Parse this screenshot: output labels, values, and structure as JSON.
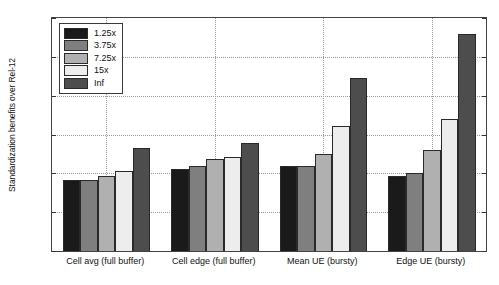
{
  "chart_data": {
    "type": "bar",
    "title": "",
    "xlabel": "",
    "ylabel": "Standardization benefits over Rel-12",
    "ylim": [
      0,
      3
    ],
    "ytick_labels": [
      "0",
      "0.5",
      "1",
      "1.5",
      "2",
      "2.5",
      "3"
    ],
    "ytick_values": [
      0,
      0.5,
      1,
      1.5,
      2,
      2.5,
      3
    ],
    "grid": true,
    "legend_position": "upper left (inside axes)",
    "categories": [
      "Cell avg (full buffer)",
      "Cell edge (full buffer)",
      "Mean UE (bursty)",
      "Edge UE (bursty)"
    ],
    "series": [
      {
        "name": "1.25x",
        "color": "#1a1a1a",
        "values": [
          0.91,
          1.06,
          1.09,
          0.97
        ]
      },
      {
        "name": "3.75x",
        "color": "#7f7f7f",
        "values": [
          0.91,
          1.1,
          1.09,
          1.0
        ]
      },
      {
        "name": "7.25x",
        "color": "#b0b0b0",
        "values": [
          0.97,
          1.18,
          1.25,
          1.3
        ]
      },
      {
        "name": "15x",
        "color": "#ededed",
        "values": [
          1.03,
          1.21,
          1.61,
          1.7
        ]
      },
      {
        "name": "Inf",
        "color": "#4d4d4d",
        "values": [
          1.33,
          1.39,
          2.23,
          2.79
        ]
      }
    ]
  },
  "legend": {
    "items": [
      {
        "label": "1.25x"
      },
      {
        "label": "3.75x"
      },
      {
        "label": "7.25x"
      },
      {
        "label": "15x"
      },
      {
        "label": "Inf"
      }
    ]
  }
}
